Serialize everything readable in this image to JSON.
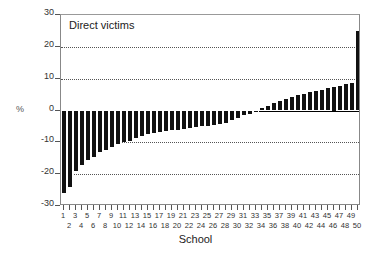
{
  "chart_data": {
    "type": "bar",
    "title": "Direct victims",
    "xlabel": "School",
    "ylabel": "%",
    "ylim": [
      -30,
      30
    ],
    "yticks": [
      30,
      20,
      10,
      0,
      -10,
      -20,
      -30
    ],
    "ytick_labels": [
      "30",
      "20",
      "10",
      "0",
      "-10",
      "-20",
      "-30"
    ],
    "gridlines": [
      20,
      10,
      -10,
      -20
    ],
    "grid": true,
    "legend": "none",
    "categories": [
      1,
      2,
      3,
      4,
      5,
      6,
      7,
      8,
      9,
      10,
      11,
      12,
      13,
      14,
      15,
      16,
      17,
      18,
      19,
      20,
      21,
      22,
      23,
      24,
      25,
      26,
      27,
      28,
      29,
      30,
      31,
      32,
      33,
      34,
      35,
      36,
      37,
      38,
      39,
      40,
      41,
      42,
      43,
      44,
      45,
      46,
      47,
      48,
      49,
      50
    ],
    "values": [
      -26.0,
      -24.0,
      -19.0,
      -17.0,
      -15.5,
      -14.5,
      -13.0,
      -12.5,
      -11.5,
      -10.5,
      -10.0,
      -9.5,
      -8.5,
      -8.0,
      -7.5,
      -7.0,
      -6.8,
      -6.5,
      -6.2,
      -6.0,
      -5.8,
      -5.5,
      -5.2,
      -5.0,
      -4.8,
      -4.5,
      -4.2,
      -3.8,
      -3.0,
      -2.2,
      -1.5,
      -1.0,
      -0.5,
      0.8,
      1.5,
      2.2,
      3.0,
      3.5,
      4.2,
      4.8,
      5.2,
      5.8,
      6.2,
      6.5,
      7.0,
      7.5,
      7.8,
      8.2,
      8.6,
      25.0
    ],
    "xtick_labels_odd": [
      "1",
      "3",
      "5",
      "7",
      "9",
      "11",
      "13",
      "15",
      "17",
      "19",
      "21",
      "23",
      "25",
      "27",
      "29",
      "31",
      "33",
      "35",
      "37",
      "39",
      "41",
      "43",
      "45",
      "47",
      "49"
    ],
    "xtick_labels_even": [
      "2",
      "4",
      "6",
      "8",
      "10",
      "12",
      "14",
      "16",
      "18",
      "20",
      "22",
      "24",
      "26",
      "28",
      "30",
      "32",
      "34",
      "36",
      "38",
      "40",
      "42",
      "44",
      "46",
      "48",
      "50"
    ],
    "bar_color": "#111111",
    "axis_color": "#888888"
  }
}
